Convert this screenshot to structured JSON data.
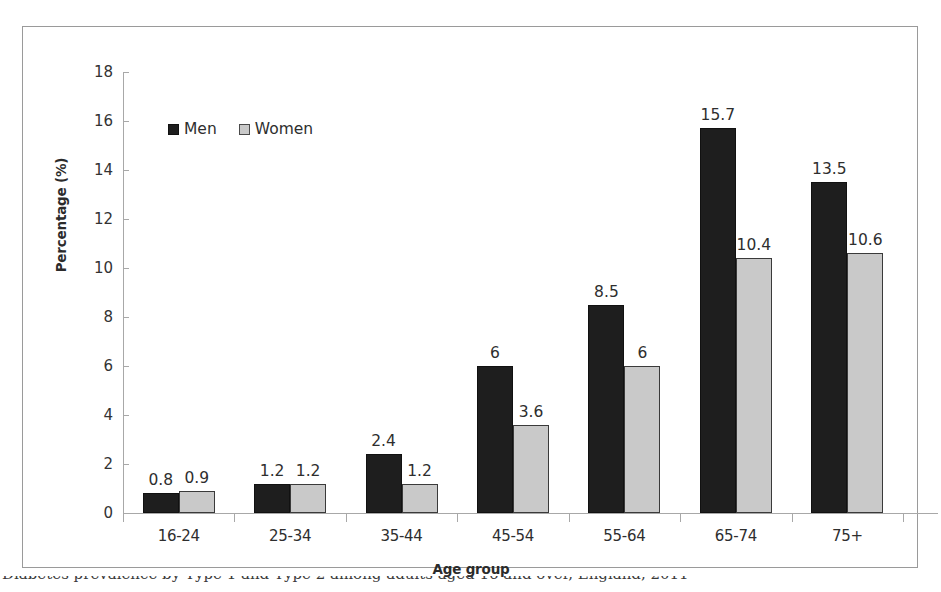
{
  "chart_data": {
    "type": "bar",
    "title": "",
    "xlabel": "Age group",
    "ylabel": "Percentage (%)",
    "categories": [
      "16-24",
      "25-34",
      "35-44",
      "45-54",
      "55-64",
      "65-74",
      "75+"
    ],
    "series": [
      {
        "name": "Men",
        "color": "#1e1e1e",
        "values": [
          0.8,
          1.2,
          2.4,
          6,
          8.5,
          15.7,
          13.5
        ]
      },
      {
        "name": "Women",
        "color": "#c9c9c9",
        "values": [
          0.9,
          1.2,
          1.2,
          3.6,
          6,
          10.4,
          10.6
        ]
      }
    ],
    "data_labels": {
      "Men": [
        "0.8",
        "1.2",
        "2.4",
        "6",
        "8.5",
        "15.7",
        "13.5"
      ],
      "Women": [
        "0.9",
        "1.2",
        "1.2",
        "3.6",
        "6",
        "10.4",
        "10.6"
      ]
    },
    "ylim": [
      0,
      18
    ],
    "yticks": [
      "0",
      "2",
      "4",
      "6",
      "8",
      "10",
      "12",
      "14",
      "16",
      "18"
    ],
    "grid": false,
    "legend_position": "top-left-inside"
  },
  "legend": {
    "men_label": "Men",
    "women_label": "Women"
  },
  "axes": {
    "y_title": "Percentage (%)",
    "x_title": "Age group"
  },
  "caption": {
    "text": "Diabetes prevalence by Type 1 and Type 2 among adults aged 16 and over, England, 2011"
  }
}
